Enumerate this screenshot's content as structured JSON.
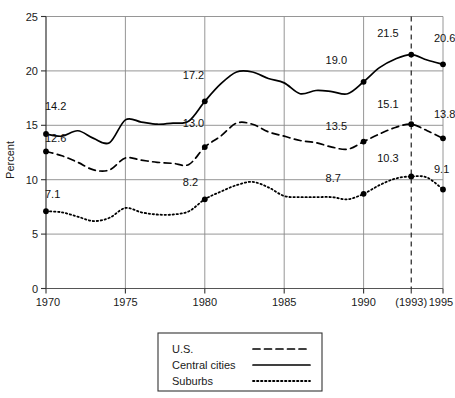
{
  "chart_data": {
    "type": "line",
    "title": "",
    "xlabel": "",
    "ylabel": "Percent",
    "xlim": [
      1970,
      1995
    ],
    "ylim": [
      0,
      25
    ],
    "grid": true,
    "legend_position": "below-plot",
    "x_tick_labels": [
      "1970",
      "1975",
      "1980",
      "1985",
      "1990",
      "(1993)",
      "1995"
    ],
    "x_tick_values": [
      1970,
      1975,
      1980,
      1985,
      1990,
      1993,
      1995
    ],
    "y_tick_labels": [
      "0",
      "5",
      "10",
      "15",
      "20",
      "25"
    ],
    "y_tick_values": [
      0,
      5,
      10,
      15,
      20,
      25
    ],
    "annotations": {
      "reference_line_year": 1993,
      "reference_line_style": "dashed"
    },
    "series": [
      {
        "name": "U.S.",
        "style": "dashed",
        "color": "#000000",
        "labeled_points": [
          {
            "x": 1970,
            "y": 12.6,
            "label": "12.6"
          },
          {
            "x": 1980,
            "y": 13.0,
            "label": "13.0"
          },
          {
            "x": 1990,
            "y": 13.5,
            "label": "13.5"
          },
          {
            "x": 1993,
            "y": 15.1,
            "label": "15.1"
          },
          {
            "x": 1995,
            "y": 13.8,
            "label": "13.8"
          }
        ],
        "x": [
          1970,
          1971,
          1972,
          1973,
          1974,
          1975,
          1976,
          1977,
          1978,
          1979,
          1980,
          1981,
          1982,
          1983,
          1984,
          1985,
          1986,
          1987,
          1988,
          1989,
          1990,
          1991,
          1992,
          1993,
          1994,
          1995
        ],
        "values": [
          12.6,
          12.2,
          11.6,
          10.9,
          10.9,
          12.0,
          11.8,
          11.6,
          11.5,
          11.4,
          13.0,
          14.0,
          15.2,
          15.1,
          14.4,
          14.0,
          13.6,
          13.4,
          13.0,
          12.8,
          13.5,
          14.2,
          14.8,
          15.1,
          14.5,
          13.8
        ]
      },
      {
        "name": "Central cities",
        "style": "solid",
        "color": "#000000",
        "labeled_points": [
          {
            "x": 1970,
            "y": 14.2,
            "label": "14.2"
          },
          {
            "x": 1980,
            "y": 17.2,
            "label": "17.2"
          },
          {
            "x": 1990,
            "y": 19.0,
            "label": "19.0"
          },
          {
            "x": 1993,
            "y": 21.5,
            "label": "21.5"
          },
          {
            "x": 1995,
            "y": 20.6,
            "label": "20.6"
          }
        ],
        "x": [
          1970,
          1971,
          1972,
          1973,
          1974,
          1975,
          1976,
          1977,
          1978,
          1979,
          1980,
          1981,
          1982,
          1983,
          1984,
          1985,
          1986,
          1987,
          1988,
          1989,
          1990,
          1991,
          1992,
          1993,
          1994,
          1995
        ],
        "values": [
          14.2,
          14.0,
          14.5,
          13.8,
          13.4,
          15.5,
          15.3,
          15.1,
          15.2,
          15.4,
          17.2,
          18.8,
          19.9,
          19.9,
          19.3,
          18.9,
          17.9,
          18.2,
          18.1,
          17.9,
          19.0,
          20.3,
          21.1,
          21.5,
          21.0,
          20.6
        ]
      },
      {
        "name": "Suburbs",
        "style": "dotted",
        "color": "#000000",
        "labeled_points": [
          {
            "x": 1970,
            "y": 7.1,
            "label": "7.1"
          },
          {
            "x": 1980,
            "y": 8.2,
            "label": "8.2"
          },
          {
            "x": 1990,
            "y": 8.7,
            "label": "8.7"
          },
          {
            "x": 1993,
            "y": 10.3,
            "label": "10.3"
          },
          {
            "x": 1995,
            "y": 9.1,
            "label": "9.1"
          }
        ],
        "x": [
          1970,
          1971,
          1972,
          1973,
          1974,
          1975,
          1976,
          1977,
          1978,
          1979,
          1980,
          1981,
          1982,
          1983,
          1984,
          1985,
          1986,
          1987,
          1988,
          1989,
          1990,
          1991,
          1992,
          1993,
          1994,
          1995
        ],
        "values": [
          7.1,
          7.0,
          6.6,
          6.2,
          6.5,
          7.4,
          7.0,
          6.8,
          6.8,
          7.1,
          8.2,
          8.9,
          9.5,
          9.8,
          9.3,
          8.5,
          8.4,
          8.4,
          8.4,
          8.2,
          8.7,
          9.5,
          10.1,
          10.3,
          10.2,
          9.1
        ]
      }
    ]
  },
  "legend": {
    "entries": [
      {
        "label": "U.S.",
        "style": "dashed"
      },
      {
        "label": "Central cities",
        "style": "solid"
      },
      {
        "label": "Suburbs",
        "style": "dotted"
      }
    ]
  },
  "axis": {
    "y_title": "Percent"
  }
}
